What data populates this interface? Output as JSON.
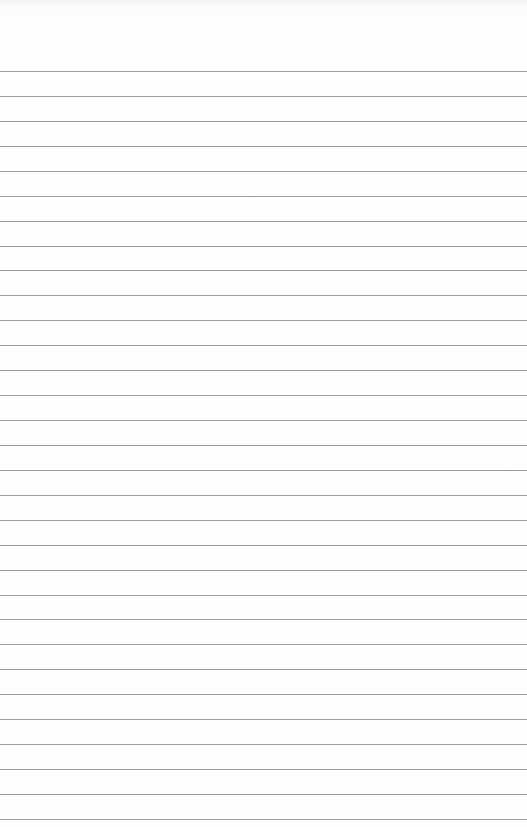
{
  "paper": {
    "type": "lined-paper",
    "background_color": "#ffffff",
    "line_color": "#8c8c8c",
    "first_line_y": 71,
    "line_spacing": 24.93,
    "line_count": 31
  }
}
